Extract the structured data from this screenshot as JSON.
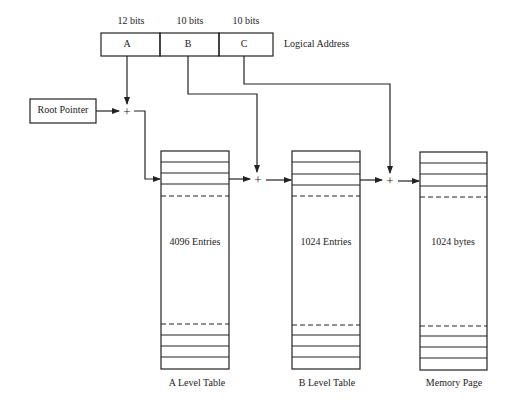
{
  "address": {
    "fields": [
      {
        "name": "A",
        "bits": "12 bits"
      },
      {
        "name": "B",
        "bits": "10 bits"
      },
      {
        "name": "C",
        "bits": "10 bits"
      }
    ],
    "label": "Logical Address"
  },
  "root_pointer": {
    "label": "Root Pointer"
  },
  "adder_symbol": "+",
  "tables": [
    {
      "title": "A Level Table",
      "content": "4096 Entries"
    },
    {
      "title": "B Level Table",
      "content": "1024 Entries"
    },
    {
      "title": "Memory Page",
      "content": "1024 bytes"
    }
  ],
  "colors": {
    "line": "#222222",
    "background": "#ffffff"
  }
}
